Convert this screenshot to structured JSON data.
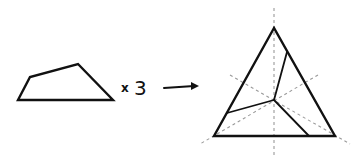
{
  "diagram": {
    "multiplier_symbol": "x",
    "multiplier_value": "3",
    "arrow": "right-arrow",
    "colors": {
      "stroke": "#111111",
      "dashed": "#9a9a9a",
      "background": "#ffffff"
    },
    "quadrilateral": {
      "points": "18,100 30,77 78,64 113,100"
    },
    "triangle": {
      "points": "274,28 214,136 335,136",
      "center": [
        274,
        100
      ]
    },
    "inner_cuts": [
      {
        "x1": 274,
        "y1": 100,
        "x2": 287,
        "y2": 52
      },
      {
        "x1": 274,
        "y1": 100,
        "x2": 227,
        "y2": 113
      },
      {
        "x1": 274,
        "y1": 100,
        "x2": 309,
        "y2": 136
      }
    ],
    "symmetry_axes": [
      {
        "x1": 274,
        "y1": 8,
        "x2": 274,
        "y2": 156
      },
      {
        "x1": 230,
        "y1": 75,
        "x2": 350,
        "y2": 144
      },
      {
        "x1": 318,
        "y1": 75,
        "x2": 200,
        "y2": 144
      }
    ]
  }
}
